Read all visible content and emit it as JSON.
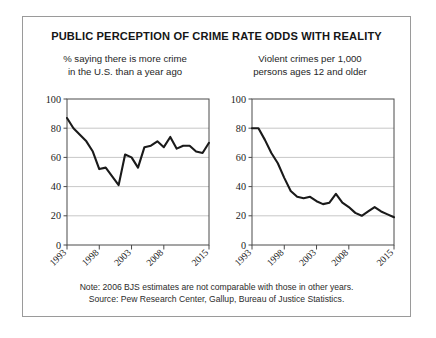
{
  "figure": {
    "title": "PUBLIC PERCEPTION OF CRIME RATE ODDS WITH REALITY",
    "footnote_line1": "Note: 2006 BJS estimates are not comparable with those in other years.",
    "footnote_line2": "Source: Pew Research Center, Gallup, Bureau of Justice Statistics.",
    "border_color": "#9a9a9a",
    "line_color": "#1a1a1a",
    "grid_color": "#b9b9b9"
  },
  "chart_data": [
    {
      "type": "line",
      "title": "% saying there is more crime in the U.S. than a year ago",
      "subtitle_line1": "% saying there is more crime",
      "subtitle_line2": "in the U.S. than a year ago",
      "xlabel": "",
      "ylabel": "",
      "ylim": [
        0,
        100
      ],
      "xlim": [
        1993,
        2015
      ],
      "yticks": [
        0,
        20,
        40,
        60,
        80,
        100
      ],
      "xticks": [
        1993,
        1998,
        2003,
        2008,
        2015
      ],
      "xtick_labels": [
        "1993",
        "1998",
        "2003",
        "2008",
        "2015"
      ],
      "grid": true,
      "legend": "none",
      "x": [
        1993,
        1994,
        1996,
        1997,
        1998,
        1999,
        2000,
        2001,
        2002,
        2003,
        2004,
        2005,
        2006,
        2007,
        2008,
        2009,
        2010,
        2011,
        2012,
        2013,
        2014,
        2015
      ],
      "values": [
        87,
        80,
        71,
        64,
        52,
        53,
        47,
        41,
        62,
        60,
        53,
        67,
        68,
        71,
        67,
        74,
        66,
        68,
        68,
        64,
        63,
        70
      ]
    },
    {
      "type": "line",
      "title": "Violent crimes per 1,000 persons ages 12 and older",
      "subtitle_line1": "Violent crimes per 1,000",
      "subtitle_line2": "persons ages 12 and older",
      "xlabel": "",
      "ylabel": "",
      "ylim": [
        0,
        100
      ],
      "xlim": [
        1993,
        2015
      ],
      "yticks": [
        0,
        20,
        40,
        60,
        80,
        100
      ],
      "xticks": [
        1993,
        1998,
        2003,
        2008,
        2015
      ],
      "xtick_labels": [
        "1993",
        "1998",
        "2003",
        "2008",
        "2015"
      ],
      "grid": true,
      "legend": "none",
      "x": [
        1993,
        1994,
        1995,
        1996,
        1997,
        1998,
        1999,
        2000,
        2001,
        2002,
        2003,
        2004,
        2005,
        2006,
        2007,
        2008,
        2009,
        2010,
        2011,
        2012,
        2013,
        2014,
        2015
      ],
      "values": [
        80,
        80,
        72,
        63,
        56,
        46,
        37,
        33,
        32,
        33,
        30,
        28,
        29,
        35,
        29,
        26,
        22,
        20,
        23,
        26,
        23,
        21,
        19
      ]
    }
  ]
}
